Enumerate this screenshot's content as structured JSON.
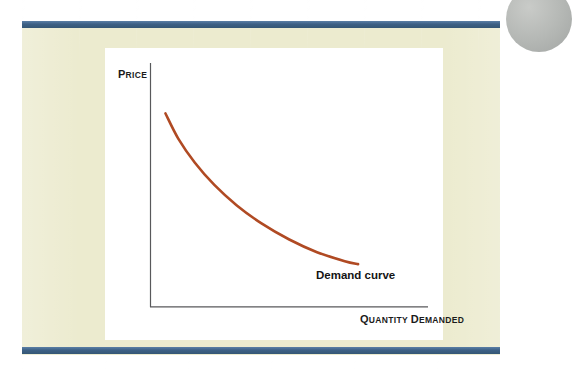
{
  "slide": {
    "background_color": "#ffffff",
    "page_color": "#ecebcf",
    "rule_color": "#3d6085",
    "corner_marker_color": "#b4b7b4"
  },
  "figure": {
    "card_color": "#ffffff",
    "axis_color": "#58595b",
    "curve_color": "#b04a23"
  },
  "axes": {
    "y_title_lead": "P",
    "y_title_rest": "RICE",
    "y_title_full": "PRICE",
    "x_title_lead": "Q",
    "x_title_rest": "UANTITY",
    "x_title_lead2": "D",
    "x_title_rest2": "EMANDED",
    "x_title_full": "QUANTITY DEMANDED"
  },
  "annotations": {
    "curve_label": "Demand curve"
  },
  "chart_data": {
    "type": "line",
    "title": "",
    "xlabel": "QUANTITY DEMANDED",
    "ylabel": "PRICE",
    "grid": false,
    "legend": "none",
    "axis_style": "qualitative-no-ticks",
    "xlim": [
      0,
      1
    ],
    "ylim": [
      0,
      1
    ],
    "series": [
      {
        "name": "Demand curve",
        "color": "#b04a23",
        "shape": "convex-decreasing",
        "label_text": "Demand curve",
        "x": [
          0.054,
          0.1,
          0.16,
          0.23,
          0.31,
          0.4,
          0.5,
          0.6,
          0.7,
          0.748
        ],
        "y": [
          0.793,
          0.69,
          0.591,
          0.5,
          0.417,
          0.342,
          0.276,
          0.224,
          0.187,
          0.175
        ]
      }
    ]
  }
}
